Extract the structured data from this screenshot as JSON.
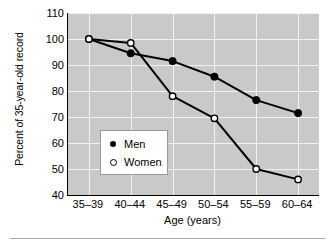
{
  "chart_data": {
    "type": "line",
    "title": "",
    "xlabel": "Age (years)",
    "ylabel": "Percent of 35-year-old record",
    "categories": [
      "35–39",
      "40–44",
      "45–49",
      "50–54",
      "55–59",
      "60–64"
    ],
    "ylim": [
      40,
      110
    ],
    "yticks": [
      40,
      50,
      60,
      70,
      80,
      90,
      100,
      110
    ],
    "ytick_labels": [
      "40",
      "50",
      "60",
      "70",
      "80",
      "90",
      "100",
      "110"
    ],
    "grid": true,
    "legend_position": "center-left",
    "series": [
      {
        "name": "Men",
        "marker": "filled-circle",
        "color": "#000000",
        "values": [
          100,
          94.5,
          91.5,
          85.5,
          76.5,
          71.5
        ]
      },
      {
        "name": "Women",
        "marker": "open-circle",
        "color": "#000000",
        "values": [
          100,
          98.5,
          78,
          69.5,
          50,
          46
        ]
      }
    ],
    "plot_background": "#c9c9c9",
    "grid_color": "#f2f2f2"
  },
  "legend": {
    "items": [
      {
        "label": "Men",
        "marker": "filled-circle"
      },
      {
        "label": "Women",
        "marker": "open-circle"
      }
    ]
  }
}
